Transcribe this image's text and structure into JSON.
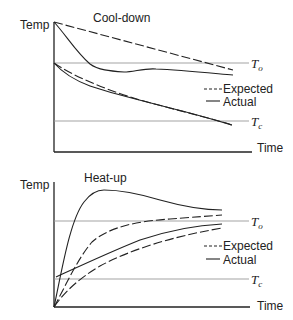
{
  "panels": [
    {
      "title": "Cool-down",
      "y_label": "Temp",
      "x_label": "Time",
      "ref_lines": {
        "upper": {
          "symbol": "T",
          "subscript": "o"
        },
        "lower": {
          "symbol": "T",
          "subscript": "c"
        }
      },
      "legend": {
        "expected": "Expected",
        "actual": "Actual"
      }
    },
    {
      "title": "Heat-up",
      "y_label": "Temp",
      "x_label": "Time",
      "ref_lines": {
        "upper": {
          "symbol": "T",
          "subscript": "o"
        },
        "lower": {
          "symbol": "T",
          "subscript": "c"
        }
      },
      "legend": {
        "expected": "Expected",
        "actual": "Actual"
      }
    }
  ],
  "colors": {
    "line": "#222222",
    "reference": "#999999",
    "background": "#ffffff"
  }
}
